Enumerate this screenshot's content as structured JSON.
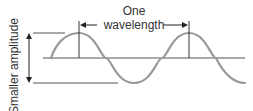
{
  "diagram": {
    "title_line1": "One",
    "title_line2": "wavelength",
    "amplitude_label": "Smaller amplitude",
    "colors": {
      "wave": "#9a9a9a",
      "lines": "#333333",
      "text": "#333333"
    }
  }
}
